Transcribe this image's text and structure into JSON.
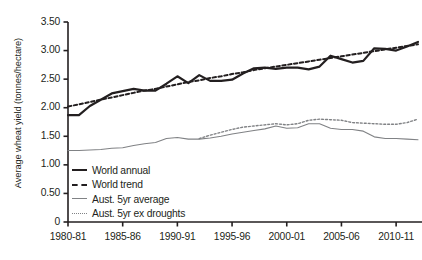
{
  "chart_data": {
    "type": "line",
    "title": "",
    "xlabel": "",
    "ylabel": "Average wheat yield (tonnes/hectare)",
    "ylim": [
      0,
      3.5
    ],
    "yticks": [
      "0",
      "0.50",
      "1.00",
      "1.50",
      "2.00",
      "2.50",
      "3.00",
      "3.50"
    ],
    "ytick_values": [
      0,
      0.5,
      1.0,
      1.5,
      2.0,
      2.5,
      3.0,
      3.5
    ],
    "grid": false,
    "legend_position": "inside-lower-left",
    "x": [
      "1980-81",
      "1981-82",
      "1982-83",
      "1983-84",
      "1984-85",
      "1985-86",
      "1986-87",
      "1987-88",
      "1988-89",
      "1989-90",
      "1990-91",
      "1991-92",
      "1992-93",
      "1993-94",
      "1994-95",
      "1995-96",
      "1996-97",
      "1997-98",
      "1998-99",
      "1999-00",
      "2000-01",
      "2001-02",
      "2002-03",
      "2003-04",
      "2004-05",
      "2005-06",
      "2006-07",
      "2007-08",
      "2008-09",
      "2009-10",
      "2010-11",
      "2011-12",
      "2012-13"
    ],
    "xticks": [
      "1980-81",
      "1985-86",
      "1990-91",
      "1995-96",
      "2000-01",
      "2005-06",
      "2010-11"
    ],
    "xtick_indices": [
      0,
      5,
      10,
      15,
      20,
      25,
      30
    ],
    "series": [
      {
        "name": "World annual",
        "style": "solid",
        "color": "#231f20",
        "width": 2.2,
        "values": [
          1.87,
          1.87,
          2.03,
          2.14,
          2.25,
          2.29,
          2.33,
          2.3,
          2.3,
          2.42,
          2.55,
          2.43,
          2.57,
          2.47,
          2.47,
          2.49,
          2.6,
          2.69,
          2.7,
          2.68,
          2.7,
          2.7,
          2.67,
          2.72,
          2.91,
          2.85,
          2.79,
          2.82,
          3.04,
          3.03,
          3.0,
          3.07,
          3.15
        ]
      },
      {
        "name": "World trend",
        "style": "dashed",
        "color": "#231f20",
        "width": 2.0,
        "values": [
          2.02,
          2.06,
          2.1,
          2.14,
          2.18,
          2.22,
          2.26,
          2.3,
          2.33,
          2.37,
          2.41,
          2.45,
          2.48,
          2.52,
          2.55,
          2.59,
          2.62,
          2.66,
          2.69,
          2.72,
          2.75,
          2.78,
          2.81,
          2.84,
          2.87,
          2.9,
          2.93,
          2.96,
          2.99,
          3.02,
          3.05,
          3.08,
          3.11
        ]
      },
      {
        "name": "Aust. 5yr average",
        "style": "solid",
        "color": "#808285",
        "width": 1.1,
        "values": [
          1.25,
          1.25,
          1.26,
          1.27,
          1.29,
          1.3,
          1.34,
          1.37,
          1.39,
          1.46,
          1.48,
          1.45,
          1.45,
          1.47,
          1.5,
          1.54,
          1.57,
          1.6,
          1.63,
          1.68,
          1.64,
          1.65,
          1.72,
          1.72,
          1.64,
          1.62,
          1.62,
          1.59,
          1.49,
          1.46,
          1.46,
          1.45,
          1.44
        ]
      },
      {
        "name": "Aust. 5yr ex droughts",
        "style": "dotted",
        "color": "#808285",
        "width": 1.4,
        "start_index": 12,
        "values": [
          null,
          null,
          null,
          null,
          null,
          null,
          null,
          null,
          null,
          null,
          null,
          null,
          1.46,
          1.52,
          1.57,
          1.62,
          1.66,
          1.68,
          1.7,
          1.72,
          1.7,
          1.72,
          1.78,
          1.8,
          1.79,
          1.78,
          1.74,
          1.73,
          1.72,
          1.71,
          1.71,
          1.74,
          1.8
        ]
      }
    ],
    "legend": [
      {
        "label": "World annual",
        "style": "solid",
        "color": "#231f20",
        "width": 2.2
      },
      {
        "label": "World trend",
        "style": "dashed",
        "color": "#231f20",
        "width": 2.2
      },
      {
        "label": "Aust. 5yr average",
        "style": "solid",
        "color": "#808285",
        "width": 1.2
      },
      {
        "label": "Aust. 5yr ex droughts",
        "style": "dotted",
        "color": "#808285",
        "width": 1.4
      }
    ]
  }
}
